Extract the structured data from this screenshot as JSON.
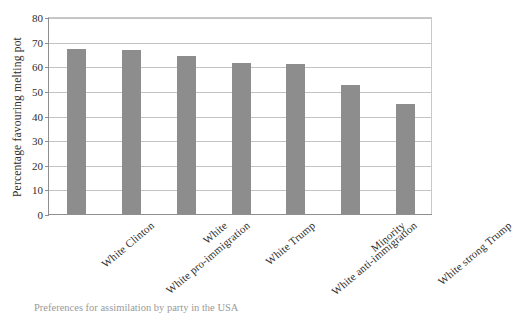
{
  "chart_data": {
    "type": "bar",
    "title": "",
    "subtitle": "",
    "xlabel": "",
    "ylabel": "Percentage favouring melting pot",
    "ylim": [
      0,
      80
    ],
    "ytick_step": 10,
    "yticks": [
      "80",
      "70",
      "60",
      "50",
      "40",
      "30",
      "20",
      "10",
      "0"
    ],
    "grid": true,
    "legend": null,
    "bar_color": "#8d8d8d",
    "axis_color": "#8f8f8f",
    "grid_color": "#c3c3c3",
    "categories": [
      "White Clinton",
      "White pro-immigration",
      "White",
      "White Trump",
      "White anti-immigration",
      "Minority",
      "White strong Trump"
    ],
    "values": [
      67,
      66.5,
      64,
      61.5,
      61,
      52.5,
      44.5
    ]
  },
  "caption": {
    "text": "Preferences for assimilation by party in the USA"
  }
}
